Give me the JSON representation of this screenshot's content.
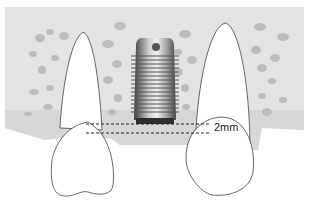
{
  "diagram": {
    "type": "dental implant placement illustration",
    "measurement_label": "2mm",
    "colors": {
      "bone": "#e3e3e3",
      "bone_spots": "#b9b9b9",
      "gum_band": "#d6d6d6",
      "tooth_fill": "#ffffff",
      "tooth_outline": "#555555",
      "dash_line": "#222222",
      "implant_dark": "#4a4a4a",
      "implant_light": "#d8d8d8"
    },
    "elements": [
      "left-tooth",
      "right-tooth",
      "implant",
      "bone-block",
      "reference-lines"
    ]
  }
}
